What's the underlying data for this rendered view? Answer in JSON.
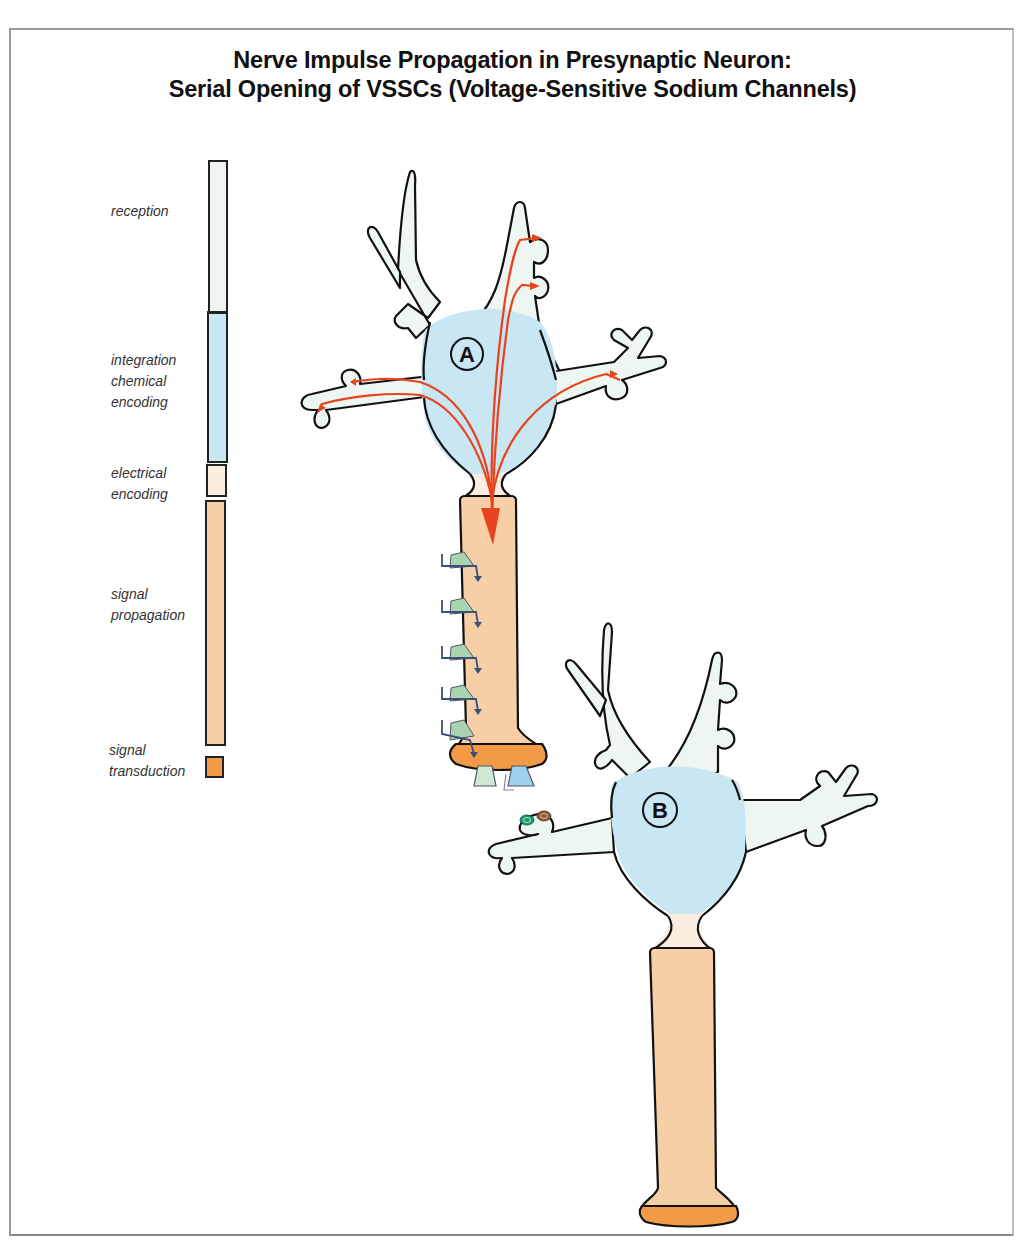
{
  "title": {
    "line1": "Nerve Impulse Propagation in Presynaptic Neuron:",
    "line2": "Serial Opening of VSSCs (Voltage-Sensitive Sodium Channels)"
  },
  "legend": {
    "items": [
      {
        "label_lines": [
          "reception"
        ],
        "color": "#eef6f1"
      },
      {
        "label_lines": [
          "integration",
          "chemical",
          "encoding"
        ],
        "color": "#c9e6f3"
      },
      {
        "label_lines": [
          "electrical",
          "encoding"
        ],
        "color": "#fbeee0"
      },
      {
        "label_lines": [
          "signal",
          "propagation"
        ],
        "color": "#f6cfa6"
      },
      {
        "label_lines": [
          "signal",
          "transduction"
        ],
        "color": "#f29a45"
      }
    ]
  },
  "neurons": {
    "a": {
      "label": "A",
      "role": "presynaptic neuron"
    },
    "b": {
      "label": "B",
      "role": "postsynaptic neuron"
    }
  },
  "colors": {
    "dendrite": "#eef6f1",
    "soma": "#c9e6f3",
    "axon_hillock": "#fbeee0",
    "axon": "#f6cfa6",
    "terminal": "#f29a45",
    "impulse_arrow": "#e8431f",
    "channel_green": "#a9d4b0",
    "channel_blue": "#9fd0ec",
    "ion_arrow": "#3a4f7a",
    "outline": "#111111"
  },
  "sodium_channels": {
    "count": 5
  },
  "terminal_receptors": {
    "count": 2
  },
  "postsynaptic_receptors": {
    "count": 2
  }
}
